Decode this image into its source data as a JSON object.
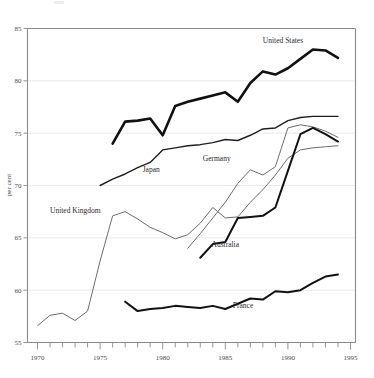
{
  "chart_data": {
    "type": "line",
    "title": "",
    "xlabel": "",
    "ylabel": "per cent",
    "xlim": [
      1969.2,
      1995.4
    ],
    "ylim": [
      55,
      85
    ],
    "grid": true,
    "legend_position": "inline-labels",
    "y_ticks": [
      55,
      60,
      65,
      70,
      75,
      80,
      85
    ],
    "y_tick_labels": [
      "55",
      "60",
      "65",
      "70",
      "75",
      "80",
      "85"
    ],
    "x_ticks": [
      1970,
      1971,
      1972,
      1973,
      1974,
      1975,
      1976,
      1977,
      1978,
      1979,
      1980,
      1981,
      1982,
      1983,
      1984,
      1985,
      1986,
      1987,
      1988,
      1989,
      1990,
      1991,
      1992,
      1993,
      1994,
      1995
    ],
    "x_tick_labels_shown": [
      "1970",
      "1975",
      "1980",
      "1985",
      "1990",
      "1995"
    ],
    "x_labeled_years": [
      1970,
      1975,
      1980,
      1985,
      1990,
      1995
    ],
    "series": [
      {
        "name": "United States",
        "label": "United States",
        "style": "thick-black",
        "color": "#111111",
        "width": 2.6,
        "label_x": 1988.0,
        "label_y": 83.6,
        "x": [
          1976,
          1977,
          1978,
          1979,
          1980,
          1981,
          1982,
          1983,
          1984,
          1985,
          1986,
          1987,
          1988,
          1989,
          1990,
          1991,
          1992,
          1993,
          1994
        ],
        "y": [
          74.0,
          76.1,
          76.2,
          76.4,
          74.8,
          77.6,
          78.0,
          78.3,
          78.6,
          78.9,
          78.0,
          79.8,
          80.9,
          80.6,
          81.2,
          82.1,
          83.0,
          82.9,
          82.2
        ]
      },
      {
        "name": "Japan",
        "label": "Japan",
        "style": "medium-dark",
        "color": "#1f1f1f",
        "width": 1.4,
        "label_x": 1978.4,
        "label_y": 71.3,
        "x": [
          1975,
          1976,
          1977,
          1978,
          1979,
          1980,
          1981,
          1982,
          1983,
          1984,
          1985,
          1986,
          1987,
          1988,
          1989,
          1990,
          1991,
          1992,
          1993,
          1994
        ],
        "y": [
          70.0,
          70.6,
          71.1,
          71.7,
          72.2,
          73.4,
          73.6,
          73.8,
          73.9,
          74.1,
          74.4,
          74.3,
          74.8,
          75.4,
          75.5,
          76.2,
          76.5,
          76.6,
          76.6,
          76.6
        ]
      },
      {
        "name": "Germany",
        "label": "Germany",
        "style": "thin-grey",
        "color": "#6d6d6d",
        "width": 1.0,
        "label_x": 1983.2,
        "label_y": 72.3,
        "x": [
          1982,
          1983,
          1984,
          1985,
          1986,
          1987,
          1988,
          1989,
          1990,
          1991,
          1992,
          1993,
          1994
        ],
        "y": [
          64.0,
          65.4,
          66.9,
          68.4,
          70.2,
          71.5,
          71.0,
          71.8,
          75.5,
          75.8,
          75.6,
          75.2,
          74.6
        ]
      },
      {
        "name": "United Kingdom",
        "label": "United Kingdom",
        "style": "thin-grey",
        "color": "#6d6d6d",
        "width": 1.0,
        "label_x": 1971.0,
        "label_y": 67.4,
        "x": [
          1970,
          1971,
          1972,
          1973,
          1974,
          1975,
          1976,
          1977,
          1978,
          1979,
          1980,
          1981,
          1982,
          1983,
          1984,
          1985,
          1986,
          1987,
          1988,
          1989,
          1990,
          1991,
          1992,
          1993,
          1994
        ],
        "y": [
          56.6,
          57.6,
          57.8,
          57.1,
          58.0,
          62.8,
          67.1,
          67.5,
          66.8,
          66.0,
          65.5,
          64.9,
          65.3,
          66.4,
          67.9,
          66.9,
          67.0,
          68.4,
          69.6,
          71.0,
          72.6,
          73.4,
          73.6,
          73.7,
          73.8
        ]
      },
      {
        "name": "Australia",
        "label": "Australia",
        "style": "thick-black",
        "color": "#111111",
        "width": 2.0,
        "label_x": 1983.9,
        "label_y": 64.1,
        "x": [
          1983,
          1984,
          1985,
          1986,
          1987,
          1988,
          1989,
          1990,
          1991,
          1992,
          1993,
          1994
        ],
        "y": [
          63.1,
          64.4,
          64.6,
          66.9,
          67.0,
          67.1,
          67.9,
          71.4,
          74.9,
          75.5,
          74.9,
          74.2
        ]
      },
      {
        "name": "France",
        "label": "France",
        "style": "thick-black",
        "color": "#111111",
        "width": 2.0,
        "label_x": 1985.6,
        "label_y": 58.3,
        "x": [
          1977,
          1978,
          1979,
          1980,
          1981,
          1982,
          1983,
          1984,
          1985,
          1986,
          1987,
          1988,
          1989,
          1990,
          1991,
          1992,
          1993,
          1994
        ],
        "y": [
          58.9,
          58.0,
          58.2,
          58.3,
          58.5,
          58.4,
          58.3,
          58.5,
          58.2,
          58.7,
          59.2,
          59.1,
          59.9,
          59.8,
          60.0,
          60.7,
          61.3,
          61.5
        ]
      }
    ]
  }
}
